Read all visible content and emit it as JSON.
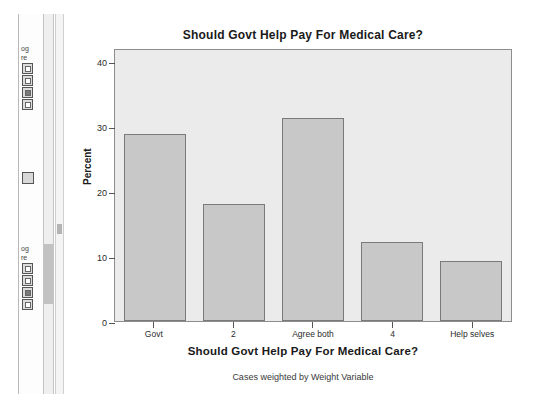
{
  "left_panel": {
    "fragment_top": "og",
    "fragment_below": "re",
    "fragment_lower_top": "og",
    "fragment_lower_below": "re"
  },
  "chart_data": {
    "type": "bar",
    "title": "Should Govt Help Pay For Medical Care?",
    "xlabel": "Should Govt Help Pay For Medical Care?",
    "ylabel": "Percent",
    "footnote": "Cases weighted by Weight Variable",
    "categories": [
      "Govt",
      "2",
      "Agree both",
      "4",
      "Help selves"
    ],
    "values": [
      28.7,
      18.0,
      31.3,
      12.2,
      9.3
    ],
    "ylim": [
      0,
      42
    ],
    "yticks": [
      0,
      10,
      20,
      30,
      40
    ],
    "ytick_labels": [
      "0",
      "10",
      "20",
      "30",
      "40"
    ],
    "grid": false,
    "legend": "none",
    "colors": {
      "bar_fill": "#c8c8c8",
      "bar_border": "#7a7a7a",
      "plot_background": "#ebebeb",
      "page_background": "#ffffff",
      "text": "#1a1a1a"
    }
  }
}
